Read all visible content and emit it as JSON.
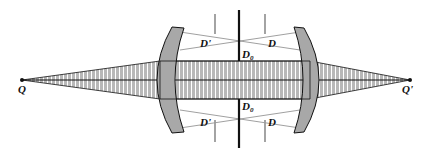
{
  "diagram": {
    "labels": {
      "object_point": "Q",
      "image_point": "Q'",
      "stop_top": "D",
      "stop_sub": "0",
      "pupil_left_top": "D'",
      "pupil_right_top": "D",
      "pupil_left_bottom": "D'",
      "pupil_right_bottom": "D"
    },
    "colors": {
      "line": "#111111",
      "stop_gray": "#9a9a9a",
      "lens_fill": "#a8a8a8",
      "beam_fill": "#b8b8b8",
      "beam_hatch": "#ffffff"
    }
  }
}
